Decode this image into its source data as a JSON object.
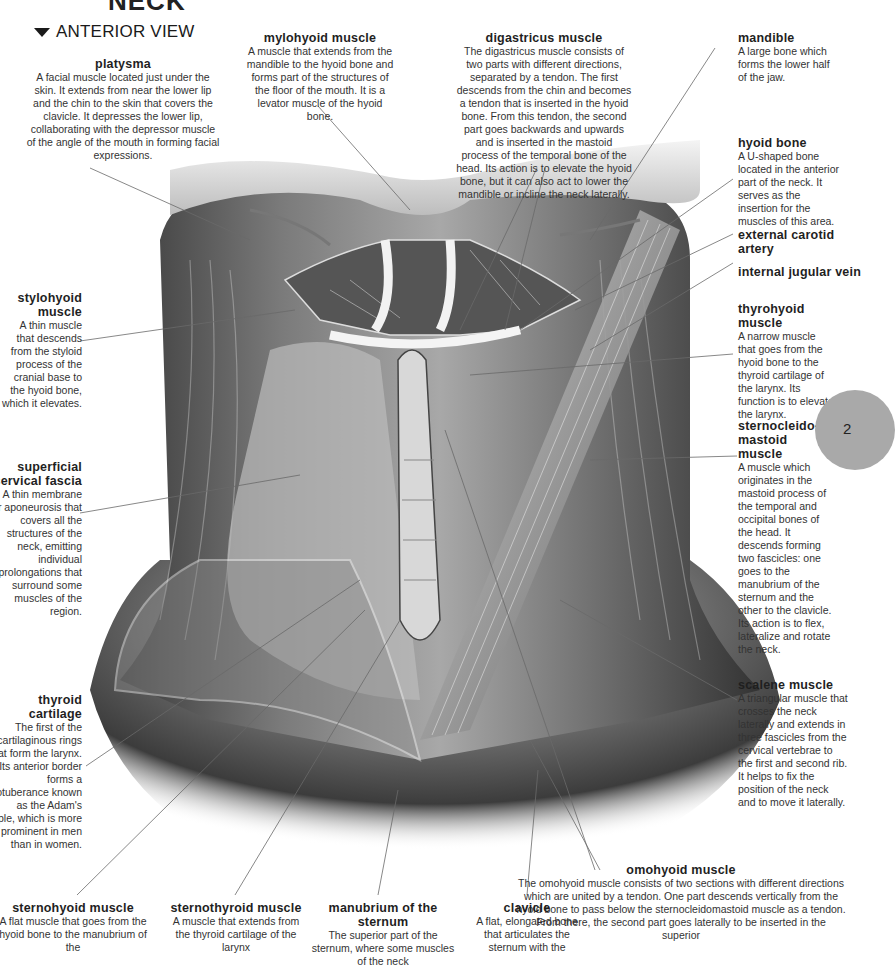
{
  "page": {
    "title": "NECK",
    "section": "ANTERIOR VIEW",
    "page_tab": "2"
  },
  "labels": {
    "platysma": {
      "title": "platysma",
      "text": "A facial muscle located just under the skin. It extends from near the lower lip and the chin to the skin that covers the clavicle. It depresses the lower lip, collaborating with the depressor muscle of the angle of the mouth in forming facial expressions."
    },
    "mylohyoid": {
      "title": "mylohyoid muscle",
      "text": "A muscle that extends from the mandible to the hyoid bone and forms part of the structures of the floor of the mouth. It is a levator muscle of the hyoid bone."
    },
    "digastricus": {
      "title": "digastricus muscle",
      "text": "The digastricus muscle consists of two parts with different directions, separated by a tendon. The first descends from the chin and becomes a tendon that is inserted in the hyoid bone. From this tendon, the second part goes backwards and upwards and is inserted in the mastoid process of the temporal bone of the head. Its action is to elevate the hyoid bone, but it can also act to lower the mandible or incline the neck laterally."
    },
    "mandible": {
      "title": "mandible",
      "text": "A large bone which forms the lower half of the jaw."
    },
    "hyoid_bone": {
      "title": "hyoid bone",
      "text": "A U-shaped bone located in the anterior part of the neck. It serves as the insertion for the muscles of this area."
    },
    "external_carotid": {
      "title": "external carotid artery"
    },
    "internal_jugular": {
      "title": "internal jugular vein"
    },
    "thyrohyoid": {
      "title": "thyrohyoid muscle",
      "text": "A narrow muscle that goes from the hyoid bone to the thyroid cartilage of the larynx. Its function is to elevate the larynx."
    },
    "sternocleidomastoid": {
      "title": "sternocleido-mastoid muscle",
      "text": "A muscle which originates in the mastoid process of the temporal and occipital bones of the head. It descends forming two fascicles: one goes to the manubrium of the sternum and the other to the clavicle. Its action is to flex, lateralize and rotate the neck."
    },
    "stylohyoid": {
      "title": "stylohyoid muscle",
      "text": "A thin muscle that descends from the styloid process of the cranial base to the hyoid bone, which it elevates."
    },
    "superficial_fascia": {
      "title": "superficial cervical fascia",
      "text": "A thin membrane or aponeurosis that covers all the structures of the neck, emitting individual prolongations that surround some muscles of the region."
    },
    "thyroid_cartilage": {
      "title": "thyroid cartilage",
      "text": "The first of the cartilaginous rings that form the larynx. Its anterior border forms a protuberance known as the Adam's apple, which is more prominent in men than in women."
    },
    "scalene": {
      "title": "scalene muscle",
      "text": "A triangular muscle that crosses the neck laterally and extends in three fascicles from the cervical vertebrae to the first and second rib. It helps to fix the position of the neck and to move it laterally."
    },
    "omohyoid": {
      "title": "omohyoid muscle",
      "text": "The omohyoid muscle consists of two sections with different directions which are united by a tendon. One part descends vertically from the hyoid bone to pass below the sternocleidomastoid muscle as a tendon. From there, the second part goes laterally to be inserted in the superior"
    },
    "sternohyoid": {
      "title": "sternohyoid muscle",
      "text": "A flat muscle that goes from the hyoid bone to the manubrium of the"
    },
    "sternothyroid": {
      "title": "sternothyroid muscle",
      "text": "A muscle that extends from the thyroid cartilage of the larynx"
    },
    "manubrium": {
      "title": "manubrium of the sternum",
      "text": "The superior part of the sternum, where some muscles of the neck"
    },
    "clavicle": {
      "title": "clavicle",
      "text": "A flat, elongated bone that articulates the sternum with the"
    }
  },
  "colors": {
    "text": "#333333",
    "heading": "#1f1f1f",
    "leader_line": "#6a6a6a",
    "page_tab": "#a9a9a9"
  }
}
